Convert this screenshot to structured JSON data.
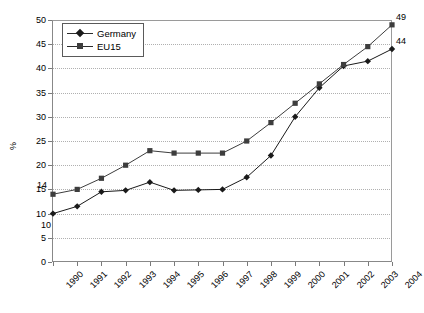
{
  "chart_data": {
    "type": "line",
    "title": "",
    "xlabel": "",
    "ylabel": "%",
    "ylim": [
      0,
      50
    ],
    "ytick_step": 5,
    "yticks": [
      0,
      5,
      10,
      15,
      20,
      25,
      30,
      35,
      40,
      45,
      50
    ],
    "grid": true,
    "grid_axis": "y",
    "legend_position": "top-left",
    "categories": [
      "1990",
      "1991",
      "1992",
      "1993",
      "1994",
      "1995",
      "1996",
      "1997",
      "1998",
      "1999",
      "2000",
      "2001",
      "2002",
      "2003",
      "2004"
    ],
    "series": [
      {
        "name": "Germany",
        "marker": "diamond",
        "color": "#1a1a1a",
        "values": [
          10,
          11.5,
          14.5,
          14.8,
          16.5,
          14.8,
          14.9,
          15,
          17.5,
          22,
          30,
          36,
          40.5,
          41.5,
          44
        ]
      },
      {
        "name": "EU15",
        "marker": "square",
        "color": "#3d3d3d",
        "values": [
          14,
          15,
          17.3,
          20,
          23,
          22.5,
          22.5,
          22.5,
          25,
          28.8,
          32.8,
          36.8,
          40.8,
          44.5,
          49
        ]
      }
    ],
    "point_labels": [
      {
        "series": "EU15",
        "category": "1990",
        "value": 14,
        "text": "14"
      },
      {
        "series": "Germany",
        "category": "1990",
        "value": 10,
        "text": "10"
      },
      {
        "series": "EU15",
        "category": "2004",
        "value": 49,
        "text": "49"
      },
      {
        "series": "Germany",
        "category": "2004",
        "value": 44,
        "text": "44"
      }
    ]
  },
  "legend": {
    "items": [
      {
        "label": "Germany"
      },
      {
        "label": "EU15"
      }
    ]
  },
  "colors": {
    "germany": "#1a1a1a",
    "eu15": "#3d3d3d",
    "axis": "#888888",
    "grid": "#b0b0b0"
  }
}
